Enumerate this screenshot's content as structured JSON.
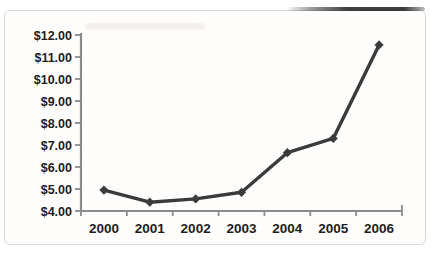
{
  "chart_data": {
    "type": "line",
    "title": "",
    "xlabel": "",
    "ylabel": "",
    "categories": [
      "2000",
      "2001",
      "2002",
      "2003",
      "2004",
      "2005",
      "2006"
    ],
    "series": [
      {
        "name": "price",
        "values": [
          4.95,
          4.4,
          4.55,
          4.85,
          6.65,
          7.3,
          11.55
        ]
      }
    ],
    "ylim": [
      4,
      12
    ],
    "y_tick_step": 1,
    "y_tick_labels": [
      "$4.00",
      "$5.00",
      "$6.00",
      "$7.00",
      "$8.00",
      "$9.00",
      "$10.00",
      "$11.00",
      "$12.00"
    ],
    "grid": false,
    "legend": "none",
    "marker": "diamond",
    "colors": {
      "line": "#3b3b3b",
      "axis": "#8c8c8c",
      "label": "#1d1d1d",
      "frame_border": "#d6d6d6",
      "background": "#ffffff"
    }
  }
}
